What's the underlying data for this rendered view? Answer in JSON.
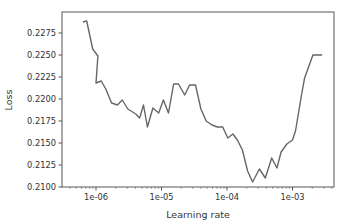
{
  "chart_data": {
    "type": "line",
    "title": "",
    "xlabel": "Learning rate",
    "ylabel": "Loss",
    "xscale": "log",
    "xlim": [
      5.2e-07,
      0.0049
    ],
    "ylim": [
      0.21,
      0.2293
    ],
    "grid": false,
    "legend": null,
    "x_ticks": [
      {
        "value": 1e-06,
        "label": "1e-06"
      },
      {
        "value": 1e-05,
        "label": "1e-05"
      },
      {
        "value": 0.0001,
        "label": "1e-04"
      },
      {
        "value": 0.001,
        "label": "1e-03"
      }
    ],
    "y_ticks": [
      {
        "value": 0.21,
        "label": "0.2100"
      },
      {
        "value": 0.2125,
        "label": "0.2125"
      },
      {
        "value": 0.215,
        "label": "0.2150"
      },
      {
        "value": 0.2175,
        "label": "0.2175"
      },
      {
        "value": 0.22,
        "label": "0.2200"
      },
      {
        "value": 0.2225,
        "label": "0.2225"
      },
      {
        "value": 0.225,
        "label": "0.2250"
      },
      {
        "value": 0.2275,
        "label": "0.2275"
      }
    ],
    "series": [
      {
        "name": "loss",
        "color": "#666666",
        "x": [
          6.3e-07,
          7.2e-07,
          8.9e-07,
          1.07e-06,
          1e-06,
          1.2e-06,
          1.41e-06,
          1.73e-06,
          2.12e-06,
          2.52e-06,
          3.06e-06,
          4.05e-06,
          4.63e-06,
          5.32e-06,
          6.1e-06,
          7.38e-06,
          9.05e-06,
          1.07e-05,
          1.28e-05,
          1.53e-05,
          1.82e-05,
          2.26e-05,
          2.69e-05,
          3.3e-05,
          4e-05,
          4.81e-05,
          5.9e-05,
          7.1e-05,
          8.6e-05,
          0.000103,
          0.000123,
          0.000144,
          0.000172,
          0.000206,
          0.000246,
          0.000312,
          0.000384,
          0.000481,
          0.000577,
          0.00067,
          0.00082,
          0.001,
          0.00111,
          0.00137,
          0.00153,
          0.00205,
          0.00283
        ],
        "y": [
          0.22875,
          0.22886,
          0.22568,
          0.22489,
          0.22182,
          0.22205,
          0.22114,
          0.21955,
          0.21932,
          0.21989,
          0.21886,
          0.2183,
          0.21784,
          0.21932,
          0.21682,
          0.21898,
          0.21841,
          0.21989,
          0.21841,
          0.2217,
          0.2217,
          0.22045,
          0.22159,
          0.22159,
          0.21886,
          0.2175,
          0.21705,
          0.21682,
          0.21682,
          0.21557,
          0.21602,
          0.21534,
          0.2142,
          0.21182,
          0.21057,
          0.21205,
          0.21102,
          0.2133,
          0.21216,
          0.21398,
          0.21489,
          0.21534,
          0.21636,
          0.22045,
          0.22239,
          0.225,
          0.225
        ]
      }
    ]
  },
  "axes": {
    "xlabel": "Learning rate",
    "ylabel": "Loss"
  }
}
